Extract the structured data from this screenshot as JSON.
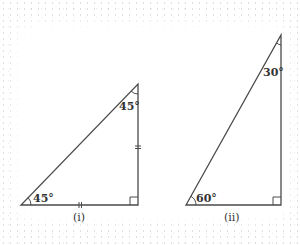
{
  "diagram": {
    "stroke_color": "#4a4a4a",
    "triangles": [
      {
        "id": "i",
        "caption": "(i)",
        "vertices": {
          "bottom_left": [
            21,
            205
          ],
          "bottom_right": [
            138,
            205
          ],
          "top": [
            138,
            84
          ]
        },
        "angles": {
          "bottom_left": "45°",
          "top": "45°",
          "bottom_right": "right angle"
        },
        "equal_side_marks": [
          "bottom",
          "right"
        ]
      },
      {
        "id": "ii",
        "caption": "(ii)",
        "vertices": {
          "bottom_left": [
            186,
            205
          ],
          "bottom_right": [
            281,
            205
          ],
          "top": [
            281,
            35
          ]
        },
        "angles": {
          "bottom_left": "60°",
          "top": "30°",
          "bottom_right": "right angle"
        }
      }
    ]
  }
}
